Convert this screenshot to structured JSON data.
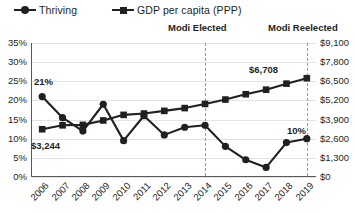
{
  "legend": [
    {
      "label": "Thriving",
      "marker": "circle-marker-icon",
      "color": "#231f20"
    },
    {
      "label": "GDP per capita (PPP)",
      "marker": "square-marker-icon",
      "color": "#231f20"
    }
  ],
  "annotations": [
    {
      "id": "modi-elected",
      "label": "Modi Elected",
      "at_year": "2014"
    },
    {
      "id": "modi-reelected",
      "label": "Modi Reelected",
      "at_year": "2019"
    }
  ],
  "data_labels": {
    "thriving_start": "21%",
    "gdp_start": "$3,244",
    "gdp_end": "$6,708",
    "thriving_end": "10%"
  },
  "chart_data": {
    "type": "line",
    "title": "",
    "subtitle": "",
    "xlabel": "",
    "ylabel": "",
    "grid": true,
    "legend_position": "top-left",
    "categories": [
      "2006",
      "2007",
      "2008",
      "2009",
      "2010",
      "2011",
      "2012",
      "2013",
      "2014",
      "2015",
      "2016",
      "2017",
      "2018",
      "2019"
    ],
    "axes": {
      "left": {
        "label": "Thriving",
        "ticks": [
          "0%",
          "5%",
          "10%",
          "15%",
          "20%",
          "25%",
          "30%",
          "35%"
        ],
        "tick_values": [
          0,
          5,
          10,
          15,
          20,
          25,
          30,
          35
        ],
        "range": [
          0,
          35
        ],
        "unit": "percent"
      },
      "right": {
        "label": "GDP per capita (PPP)",
        "ticks": [
          "$0",
          "$1,300",
          "$2,600",
          "$3,900",
          "$5,200",
          "$6,500",
          "$7,800",
          "$9,100"
        ],
        "tick_values": [
          0,
          1300,
          2600,
          3900,
          5200,
          6500,
          7800,
          9100
        ],
        "range": [
          0,
          9100
        ],
        "unit": "usd"
      }
    },
    "series": [
      {
        "name": "Thriving",
        "axis": "left",
        "marker": "circle",
        "unit": "percent",
        "values": [
          21,
          15.5,
          12,
          19,
          9.5,
          16,
          11,
          13,
          13.5,
          8,
          4.5,
          2.5,
          9,
          10
        ]
      },
      {
        "name": "GDP per capita (PPP)",
        "axis": "right",
        "marker": "square",
        "unit": "usd",
        "values": [
          3244,
          3510,
          3540,
          3840,
          4220,
          4310,
          4490,
          4680,
          4960,
          5260,
          5620,
          5930,
          6340,
          6708
        ]
      }
    ],
    "vertical_markers": [
      {
        "label": "Modi Elected",
        "x": "2014"
      },
      {
        "label": "Modi Reelected",
        "x": "2019"
      }
    ]
  }
}
